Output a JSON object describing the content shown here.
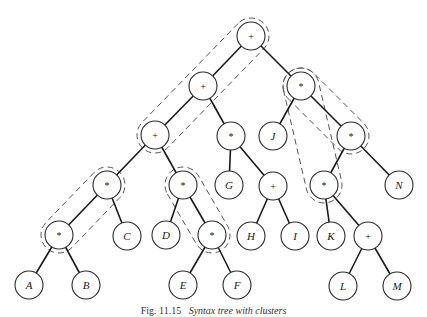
{
  "caption": {
    "figure_number": "Fig. 11.15",
    "title": "Syntax tree with clusters"
  },
  "tree": {
    "nodes": [
      {
        "id": "n0",
        "label": "+",
        "kind": "operator"
      },
      {
        "id": "n1",
        "label": "+",
        "kind": "operator"
      },
      {
        "id": "n2",
        "label": "*",
        "kind": "operator"
      },
      {
        "id": "n3",
        "label": "+",
        "kind": "operator"
      },
      {
        "id": "n4",
        "label": "*",
        "kind": "operator"
      },
      {
        "id": "n5",
        "label": "J",
        "kind": "operand"
      },
      {
        "id": "n6",
        "label": "*",
        "kind": "operator"
      },
      {
        "id": "n7",
        "label": "*",
        "kind": "operator"
      },
      {
        "id": "n8",
        "label": "*",
        "kind": "operator"
      },
      {
        "id": "n9",
        "label": "G",
        "kind": "operand"
      },
      {
        "id": "n10",
        "label": "+",
        "kind": "operator"
      },
      {
        "id": "n11",
        "label": "*",
        "kind": "operator"
      },
      {
        "id": "n12",
        "label": "N",
        "kind": "operand"
      },
      {
        "id": "n13",
        "label": "*",
        "kind": "operator"
      },
      {
        "id": "n14",
        "label": "C",
        "kind": "operand"
      },
      {
        "id": "n15",
        "label": "D",
        "kind": "operand"
      },
      {
        "id": "n16",
        "label": "*",
        "kind": "operator"
      },
      {
        "id": "n17",
        "label": "H",
        "kind": "operand"
      },
      {
        "id": "n18",
        "label": "I",
        "kind": "operand"
      },
      {
        "id": "n19",
        "label": "K",
        "kind": "operand"
      },
      {
        "id": "n20",
        "label": "+",
        "kind": "operator"
      },
      {
        "id": "n21",
        "label": "A",
        "kind": "operand"
      },
      {
        "id": "n22",
        "label": "B",
        "kind": "operand"
      },
      {
        "id": "n23",
        "label": "E",
        "kind": "operand"
      },
      {
        "id": "n24",
        "label": "F",
        "kind": "operand"
      },
      {
        "id": "n25",
        "label": "L",
        "kind": "operand"
      },
      {
        "id": "n26",
        "label": "M",
        "kind": "operand"
      }
    ],
    "edges": [
      [
        "n0",
        "n1"
      ],
      [
        "n0",
        "n2"
      ],
      [
        "n1",
        "n3"
      ],
      [
        "n1",
        "n4"
      ],
      [
        "n2",
        "n5"
      ],
      [
        "n2",
        "n6"
      ],
      [
        "n3",
        "n7"
      ],
      [
        "n3",
        "n8"
      ],
      [
        "n4",
        "n9"
      ],
      [
        "n4",
        "n10"
      ],
      [
        "n6",
        "n11"
      ],
      [
        "n6",
        "n12"
      ],
      [
        "n7",
        "n13"
      ],
      [
        "n7",
        "n14"
      ],
      [
        "n8",
        "n15"
      ],
      [
        "n8",
        "n16"
      ],
      [
        "n10",
        "n17"
      ],
      [
        "n10",
        "n18"
      ],
      [
        "n11",
        "n19"
      ],
      [
        "n11",
        "n20"
      ],
      [
        "n13",
        "n21"
      ],
      [
        "n13",
        "n22"
      ],
      [
        "n16",
        "n23"
      ],
      [
        "n16",
        "n24"
      ],
      [
        "n20",
        "n25"
      ],
      [
        "n20",
        "n26"
      ]
    ],
    "clusters": [
      {
        "name": "plus-chain",
        "members": [
          "n0",
          "n1",
          "n3"
        ]
      },
      {
        "name": "star-chain-right",
        "members": [
          "n2",
          "n6",
          "n11"
        ]
      },
      {
        "name": "star-chain-left",
        "members": [
          "n7",
          "n13"
        ]
      },
      {
        "name": "star-chain-middle",
        "members": [
          "n8",
          "n16"
        ]
      }
    ]
  }
}
